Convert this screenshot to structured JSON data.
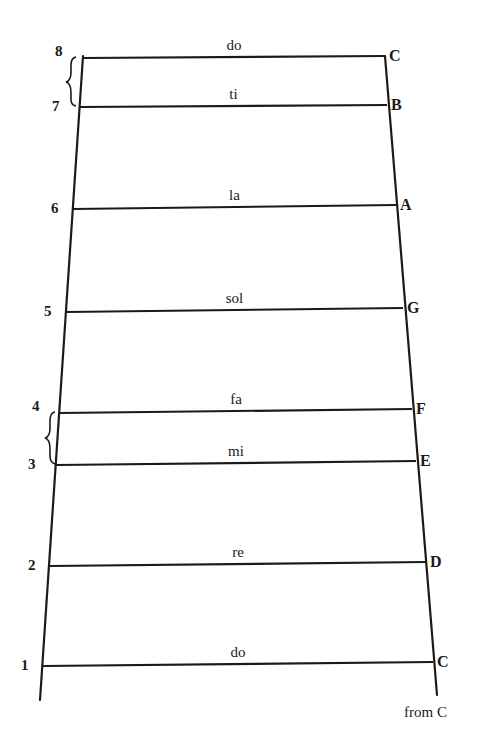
{
  "diagram": {
    "title": "",
    "type": "scale-ladder",
    "caption": "from C",
    "stroke_color": "#1a1a1a",
    "rails": {
      "left": {
        "x1": 83,
        "y1": 56,
        "x2": 40,
        "y2": 700
      },
      "right": {
        "x1": 385,
        "y1": 56,
        "x2": 437,
        "y2": 695
      }
    },
    "rungs": [
      {
        "degree": "8",
        "syllable": "do",
        "note": "C",
        "lx": 83,
        "ly": 58,
        "rx": 385,
        "ry": 56
      },
      {
        "degree": "7",
        "syllable": "ti",
        "note": "B",
        "lx": 80,
        "ly": 107,
        "rx": 387,
        "ry": 105
      },
      {
        "degree": "6",
        "syllable": "la",
        "note": "A",
        "lx": 73,
        "ly": 209,
        "rx": 396,
        "ry": 205
      },
      {
        "degree": "5",
        "syllable": "sol",
        "note": "G",
        "lx": 66,
        "ly": 312,
        "rx": 403,
        "ry": 308
      },
      {
        "degree": "4",
        "syllable": "fa",
        "note": "F",
        "lx": 60,
        "ly": 413,
        "rx": 412,
        "ry": 409
      },
      {
        "degree": "3",
        "syllable": "mi",
        "note": "E",
        "lx": 56,
        "ly": 465,
        "rx": 416,
        "ry": 461
      },
      {
        "degree": "2",
        "syllable": "re",
        "note": "D",
        "lx": 50,
        "ly": 566,
        "rx": 426,
        "ry": 562
      },
      {
        "degree": "1",
        "syllable": "do",
        "note": "C",
        "lx": 43,
        "ly": 666,
        "rx": 433,
        "ry": 662
      }
    ],
    "half_step_braces": [
      {
        "between": [
          "8",
          "7"
        ],
        "label": "half step 7-8"
      },
      {
        "between": [
          "4",
          "3"
        ],
        "label": "half step 3-4"
      }
    ]
  }
}
